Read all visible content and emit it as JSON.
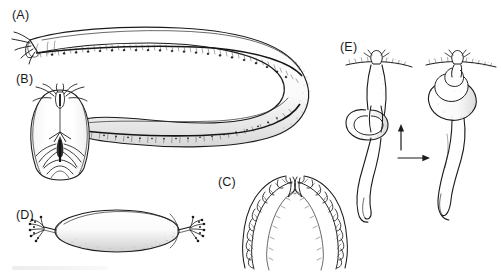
{
  "figure": {
    "kind": "scientific-illustration-plate",
    "background_color": "#ffffff",
    "ink_color": "#1b1b1b",
    "width": 501,
    "height": 277,
    "panels": [
      {
        "id": "A",
        "label": "(A)",
        "label_x": 12,
        "label_y": 8,
        "description": "whole hagfish body in lateral view, curved into a U-bend, with row of slime pores along the ventral margin and barbels at the anterior end"
      },
      {
        "id": "B",
        "label": "(B)",
        "label_x": 16,
        "label_y": 72,
        "description": "ventral view of the head showing nasal barbels, oral tentacles and the lingual dental plate"
      },
      {
        "id": "C",
        "label": "(C)",
        "label_x": 218,
        "label_y": 175,
        "description": "paired keratinous tooth combs of the rasping tongue, mirrored left and right rows"
      },
      {
        "id": "D",
        "label": "(D)",
        "label_x": 16,
        "label_y": 208,
        "description": "elongate ellipsoidal egg capsule with tufts of anchor filaments at both poles"
      },
      {
        "id": "E",
        "label": "(E)",
        "label_x": 340,
        "label_y": 40,
        "description": "two-stage knotting behaviour sequence; body knot slides from mid-body toward the head"
      }
    ],
    "arrows": [
      {
        "name": "knot-travel-arrow",
        "direction": "up",
        "x": 401,
        "y": 128,
        "length": 22
      },
      {
        "name": "sequence-arrow",
        "direction": "right",
        "x": 398,
        "y": 158,
        "length": 30
      }
    ]
  }
}
